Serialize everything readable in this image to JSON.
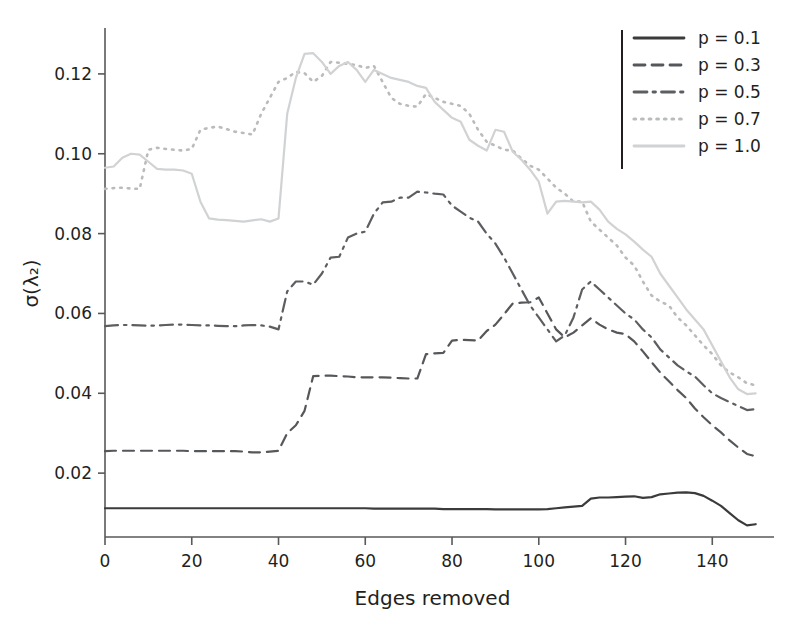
{
  "chart_data": {
    "type": "line",
    "title": "",
    "xlabel": "Edges removed",
    "ylabel": "σ(λ₂)",
    "xlim": [
      0,
      151
    ],
    "ylim": [
      0.004,
      0.131
    ],
    "xticks": [
      0,
      20,
      40,
      60,
      80,
      100,
      120,
      140
    ],
    "yticks": [
      0.02,
      0.04,
      0.06,
      0.08,
      0.1,
      0.12
    ],
    "ytick_labels": [
      "0.02",
      "0.04",
      "0.06",
      "0.08",
      "0.10",
      "0.12"
    ],
    "xtick_labels": [
      "0",
      "20",
      "40",
      "60",
      "80",
      "100",
      "120",
      "140"
    ],
    "grid": false,
    "legend_position": "top-right",
    "legend_border": "left-rule-only",
    "x": [
      0,
      2,
      4,
      6,
      8,
      10,
      12,
      14,
      16,
      18,
      20,
      22,
      24,
      26,
      28,
      30,
      32,
      34,
      36,
      38,
      40,
      42,
      44,
      46,
      48,
      50,
      52,
      54,
      56,
      58,
      60,
      62,
      64,
      66,
      68,
      70,
      72,
      74,
      76,
      78,
      80,
      82,
      84,
      86,
      88,
      90,
      92,
      94,
      96,
      98,
      100,
      102,
      104,
      106,
      108,
      110,
      112,
      114,
      116,
      118,
      120,
      122,
      124,
      126,
      128,
      130,
      132,
      134,
      136,
      138,
      140,
      142,
      144,
      146,
      148,
      150
    ],
    "series": [
      {
        "name": "p = 0.1",
        "label": "p = 0.1",
        "color": "#3b3b3b",
        "linestyle": "solid",
        "linewidth": 2.2,
        "values": [
          0.0112,
          0.0112,
          0.0112,
          0.0112,
          0.0112,
          0.0112,
          0.0112,
          0.0112,
          0.0112,
          0.0112,
          0.0112,
          0.0112,
          0.0112,
          0.0112,
          0.0112,
          0.0112,
          0.0112,
          0.0112,
          0.0112,
          0.0112,
          0.0112,
          0.0112,
          0.0112,
          0.0112,
          0.0112,
          0.0112,
          0.0112,
          0.0112,
          0.0112,
          0.0112,
          0.0112,
          0.0111,
          0.0111,
          0.0111,
          0.0111,
          0.0111,
          0.0111,
          0.0111,
          0.0111,
          0.011,
          0.011,
          0.011,
          0.011,
          0.011,
          0.011,
          0.0109,
          0.0109,
          0.0109,
          0.0109,
          0.0109,
          0.0109,
          0.011,
          0.0112,
          0.0114,
          0.0116,
          0.0118,
          0.0136,
          0.0139,
          0.0139,
          0.014,
          0.0141,
          0.0142,
          0.0138,
          0.014,
          0.0147,
          0.0149,
          0.0151,
          0.0152,
          0.015,
          0.0143,
          0.0131,
          0.0118,
          0.01,
          0.0082,
          0.0069,
          0.0072
        ]
      },
      {
        "name": "p = 0.3",
        "label": "p = 0.3",
        "color": "#55575a",
        "linestyle": "dashed",
        "linewidth": 2.2,
        "values": [
          0.0255,
          0.0256,
          0.0256,
          0.0256,
          0.0256,
          0.0256,
          0.0256,
          0.0256,
          0.0256,
          0.0256,
          0.0255,
          0.0255,
          0.0255,
          0.0255,
          0.0255,
          0.0255,
          0.0254,
          0.0252,
          0.0252,
          0.0254,
          0.0256,
          0.03,
          0.032,
          0.0356,
          0.0443,
          0.0444,
          0.0444,
          0.0443,
          0.0442,
          0.044,
          0.044,
          0.044,
          0.044,
          0.0439,
          0.0438,
          0.0437,
          0.0437,
          0.0498,
          0.05,
          0.0501,
          0.0532,
          0.0534,
          0.0533,
          0.0532,
          0.0556,
          0.0572,
          0.0598,
          0.0625,
          0.0627,
          0.0628,
          0.064,
          0.06,
          0.056,
          0.054,
          0.0552,
          0.057,
          0.0588,
          0.0572,
          0.056,
          0.0552,
          0.0548,
          0.053,
          0.0505,
          0.0478,
          0.0452,
          0.043,
          0.0408,
          0.0388,
          0.0362,
          0.034,
          0.032,
          0.0302,
          0.0282,
          0.0264,
          0.0248,
          0.0242
        ]
      },
      {
        "name": "p = 0.5",
        "label": "p = 0.5",
        "color": "#5c5e61",
        "linestyle": "dashdot",
        "linewidth": 2.2,
        "values": [
          0.0568,
          0.057,
          0.0571,
          0.0571,
          0.057,
          0.0569,
          0.057,
          0.0571,
          0.0572,
          0.0572,
          0.0571,
          0.057,
          0.057,
          0.0569,
          0.0568,
          0.0568,
          0.057,
          0.0571,
          0.057,
          0.0567,
          0.056,
          0.0655,
          0.068,
          0.068,
          0.0672,
          0.07,
          0.074,
          0.0742,
          0.079,
          0.08,
          0.0805,
          0.085,
          0.0878,
          0.088,
          0.089,
          0.089,
          0.0905,
          0.0903,
          0.09,
          0.0898,
          0.087,
          0.0855,
          0.084,
          0.083,
          0.08,
          0.0775,
          0.074,
          0.07,
          0.066,
          0.062,
          0.059,
          0.056,
          0.053,
          0.0545,
          0.059,
          0.066,
          0.068,
          0.066,
          0.064,
          0.062,
          0.06,
          0.0585,
          0.056,
          0.054,
          0.051,
          0.049,
          0.047,
          0.0455,
          0.0442,
          0.042,
          0.04,
          0.0388,
          0.0378,
          0.0368,
          0.0358,
          0.036
        ]
      },
      {
        "name": "p = 0.7",
        "label": "p = 0.7",
        "color": "#b9bbbd",
        "linestyle": "dotted",
        "linewidth": 2.6,
        "values": [
          0.0912,
          0.0914,
          0.0915,
          0.0913,
          0.0912,
          0.101,
          0.1015,
          0.1012,
          0.101,
          0.1008,
          0.1012,
          0.106,
          0.1065,
          0.1068,
          0.1062,
          0.1055,
          0.1052,
          0.1048,
          0.11,
          0.114,
          0.118,
          0.119,
          0.1205,
          0.1202,
          0.118,
          0.1195,
          0.123,
          0.1228,
          0.1225,
          0.1222,
          0.1215,
          0.122,
          0.118,
          0.114,
          0.1125,
          0.112,
          0.1118,
          0.115,
          0.114,
          0.113,
          0.1125,
          0.112,
          0.11,
          0.106,
          0.103,
          0.102,
          0.101,
          0.1008,
          0.0988,
          0.097,
          0.096,
          0.0938,
          0.0915,
          0.09,
          0.088,
          0.088,
          0.083,
          0.081,
          0.079,
          0.077,
          0.074,
          0.072,
          0.068,
          0.0645,
          0.063,
          0.062,
          0.059,
          0.057,
          0.0545,
          0.052,
          0.0498,
          0.047,
          0.0452,
          0.044,
          0.0425,
          0.042
        ]
      },
      {
        "name": "p = 1.0",
        "label": "p = 1.0",
        "color": "#d0d2d4",
        "linestyle": "solid",
        "linewidth": 2.2,
        "values": [
          0.0965,
          0.0968,
          0.099,
          0.1,
          0.0998,
          0.098,
          0.0962,
          0.096,
          0.096,
          0.0958,
          0.095,
          0.088,
          0.0838,
          0.0835,
          0.0834,
          0.0832,
          0.083,
          0.0833,
          0.0836,
          0.083,
          0.0838,
          0.11,
          0.119,
          0.125,
          0.1252,
          0.123,
          0.12,
          0.122,
          0.123,
          0.121,
          0.118,
          0.121,
          0.12,
          0.119,
          0.1185,
          0.118,
          0.117,
          0.1165,
          0.113,
          0.111,
          0.109,
          0.108,
          0.1035,
          0.102,
          0.1008,
          0.106,
          0.1055,
          0.1005,
          0.0985,
          0.096,
          0.093,
          0.085,
          0.088,
          0.0882,
          0.088,
          0.0878,
          0.088,
          0.086,
          0.083,
          0.0812,
          0.0798,
          0.078,
          0.076,
          0.0742,
          0.07,
          0.067,
          0.064,
          0.061,
          0.0585,
          0.056,
          0.052,
          0.048,
          0.044,
          0.041,
          0.0398,
          0.04
        ]
      }
    ]
  },
  "axes": {
    "x_title": "Edges removed",
    "y_title": "σ(λ₂)"
  }
}
